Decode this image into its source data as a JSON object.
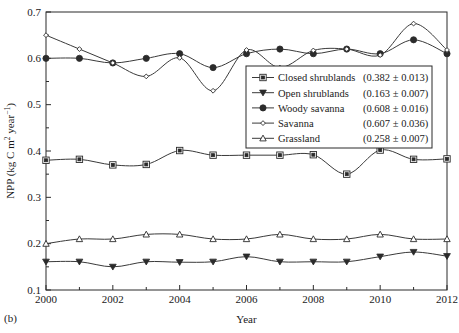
{
  "panel": {
    "label": "(b)"
  },
  "chart_data": {
    "type": "line",
    "title": "",
    "xlabel": "Year",
    "ylabel": "NPP (kg C m2 year-1)",
    "ylabel_parts": {
      "prefix": "NPP (kg C m",
      "sup1": "2",
      "mid": " year",
      "sup2": "−1",
      "suffix": ")"
    },
    "x": [
      2000,
      2001,
      2002,
      2003,
      2004,
      2005,
      2006,
      2007,
      2008,
      2009,
      2010,
      2011,
      2012
    ],
    "xlim": [
      2000,
      2012
    ],
    "ylim": [
      0.1,
      0.7
    ],
    "xticks": [
      2000,
      2002,
      2004,
      2006,
      2008,
      2010,
      2012
    ],
    "xtick_labels": [
      "2000",
      "2002",
      "2004",
      "2006",
      "2008",
      "2010",
      "2012"
    ],
    "yticks": [
      0.1,
      0.2,
      0.3,
      0.4,
      0.5,
      0.6,
      0.7
    ],
    "ytick_labels": [
      "0.1",
      "0.2",
      "0.3",
      "0.4",
      "0.5",
      "0.6",
      "0.7"
    ],
    "minor_yticks": [
      0.15,
      0.25,
      0.35,
      0.45,
      0.55,
      0.65
    ],
    "grid": false,
    "legend_position": "center-right",
    "series": [
      {
        "name": "Closed shrublands",
        "mean_label": "(0.382 ± 0.013)",
        "marker": "square-open",
        "color": "#2b2b2b",
        "values": [
          0.38,
          0.382,
          0.37,
          0.371,
          0.401,
          0.391,
          0.391,
          0.391,
          0.392,
          0.35,
          0.402,
          0.382,
          0.383
        ]
      },
      {
        "name": "Open shrublands",
        "mean_label": "(0.163 ± 0.007)",
        "marker": "triangle-down-filled",
        "color": "#2b2b2b",
        "values": [
          0.161,
          0.161,
          0.15,
          0.161,
          0.16,
          0.161,
          0.172,
          0.161,
          0.161,
          0.161,
          0.172,
          0.182,
          0.173
        ]
      },
      {
        "name": "Woody savanna",
        "mean_label": "(0.608 ± 0.016)",
        "marker": "circle-filled",
        "color": "#2b2b2b",
        "values": [
          0.6,
          0.6,
          0.59,
          0.6,
          0.61,
          0.58,
          0.61,
          0.62,
          0.61,
          0.62,
          0.61,
          0.64,
          0.61
        ]
      },
      {
        "name": "Savanna",
        "mean_label": "(0.607 ± 0.036)",
        "marker": "diamond-small",
        "color": "#2b2b2b",
        "values": [
          0.65,
          0.62,
          0.59,
          0.561,
          0.601,
          0.53,
          0.618,
          0.58,
          0.617,
          0.62,
          0.607,
          0.675,
          0.618
        ]
      },
      {
        "name": "Grassland",
        "mean_label": "(0.258 ± 0.007)",
        "marker": "triangle-up-open",
        "color": "#2b2b2b",
        "values": [
          0.2,
          0.21,
          0.21,
          0.22,
          0.22,
          0.21,
          0.21,
          0.22,
          0.21,
          0.21,
          0.22,
          0.21,
          0.21
        ]
      }
    ]
  }
}
